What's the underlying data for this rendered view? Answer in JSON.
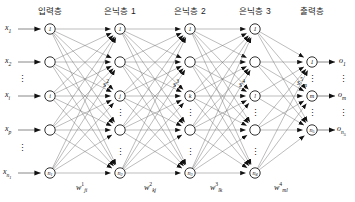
{
  "figure": {
    "type": "neural-network-diagram"
  },
  "headers": [
    {
      "label": "입력층",
      "x": 50
    },
    {
      "label": "은닉층 1",
      "x": 120
    },
    {
      "label": "은닉층 2",
      "x": 190
    },
    {
      "label": "은닉층 3",
      "x": 255
    },
    {
      "label": "출력층",
      "x": 312
    }
  ],
  "inputs": [
    {
      "base": "x",
      "sub": "1"
    },
    {
      "base": "x",
      "sub": "2"
    },
    {
      "base": "x",
      "sub": "i"
    },
    {
      "base": "x",
      "sub": "p"
    },
    {
      "base": "x",
      "sub": "n",
      "subsub": "1"
    }
  ],
  "outputs": [
    {
      "base": "o",
      "sub": "1"
    },
    {
      "base": "o",
      "sub": "m"
    },
    {
      "base": "o",
      "sub": "n",
      "subsub": "5"
    }
  ],
  "layers": [
    {
      "name": "input-layer",
      "x": 50,
      "nodes": [
        "1",
        "",
        "i",
        "",
        "n₁"
      ],
      "node_labels": [
        {
          "base": "1"
        },
        {
          "base": ""
        },
        {
          "base": "i"
        },
        {
          "base": ""
        },
        {
          "base": "n",
          "sub": "1"
        }
      ]
    },
    {
      "name": "hidden-layer-1",
      "x": 120,
      "node_labels": [
        {
          "base": "1"
        },
        {
          "base": ""
        },
        {
          "base": "j"
        },
        {
          "base": ""
        },
        {
          "base": "n",
          "sub": "2"
        }
      ],
      "activation": {
        "base": "s",
        "sup": "2",
        "sub": "j"
      },
      "weight": {
        "base": "w",
        "sup": "1",
        "sub": "ji"
      }
    },
    {
      "name": "hidden-layer-2",
      "x": 190,
      "node_labels": [
        {
          "base": "1"
        },
        {
          "base": ""
        },
        {
          "base": "k"
        },
        {
          "base": ""
        },
        {
          "base": "n",
          "sub": "3"
        }
      ],
      "activation": {
        "base": "s",
        "sup": "3",
        "sub": "k"
      },
      "weight": {
        "base": "w",
        "sup": "2",
        "sub": "kj"
      }
    },
    {
      "name": "hidden-layer-3",
      "x": 255,
      "node_labels": [
        {
          "base": "1"
        },
        {
          "base": ""
        },
        {
          "base": "l"
        },
        {
          "base": ""
        },
        {
          "base": "n",
          "sub": "4"
        }
      ],
      "activation": {
        "base": "s",
        "sup": "4",
        "sub": "l"
      },
      "weight": {
        "base": "w",
        "sup": "3",
        "sub": "lk"
      }
    },
    {
      "name": "output-layer",
      "x": 312,
      "node_labels": [
        {
          "base": "1"
        },
        {
          "base": "m"
        },
        {
          "base": "n",
          "sub": "5"
        }
      ],
      "activation": {
        "base": "s",
        "sup": "5",
        "sub": "m"
      },
      "weight": {
        "base": "w",
        "sup": "4",
        "sub": "ml"
      }
    }
  ],
  "weight_labels": [
    {
      "base": "w",
      "sup": "1",
      "sub": "ji",
      "x": 82,
      "y": 186
    },
    {
      "base": "w",
      "sup": "2",
      "sub": "kj",
      "x": 150,
      "y": 186
    },
    {
      "base": "w",
      "sup": "3",
      "sub": "lk",
      "x": 216,
      "y": 186
    },
    {
      "base": "w",
      "sup": "4",
      "sub": "ml",
      "x": 280,
      "y": 186
    }
  ],
  "activation_labels": [
    {
      "base": "s",
      "sup": "2",
      "sub": "j",
      "x": 107,
      "y": 84
    },
    {
      "base": "s",
      "sup": "3",
      "sub": "k",
      "x": 177,
      "y": 84
    },
    {
      "base": "s",
      "sup": "4",
      "sub": "l",
      "x": 243,
      "y": 84
    },
    {
      "base": "s",
      "sup": "5",
      "sub": "m",
      "x": 301,
      "y": 82
    }
  ],
  "colors": {
    "line": "#6b6b6b",
    "node_stroke": "#1a1a1a",
    "node_fill": "#ffffff",
    "arrowhead": "#111111",
    "text": "#111111",
    "background": "#ffffff"
  },
  "geometry": {
    "node_radius": 5.2,
    "row_y": [
      29,
      62,
      96,
      130,
      173
    ],
    "out_row_y": [
      62,
      96,
      130
    ],
    "layer_x": [
      50,
      120,
      190,
      255,
      312
    ]
  }
}
